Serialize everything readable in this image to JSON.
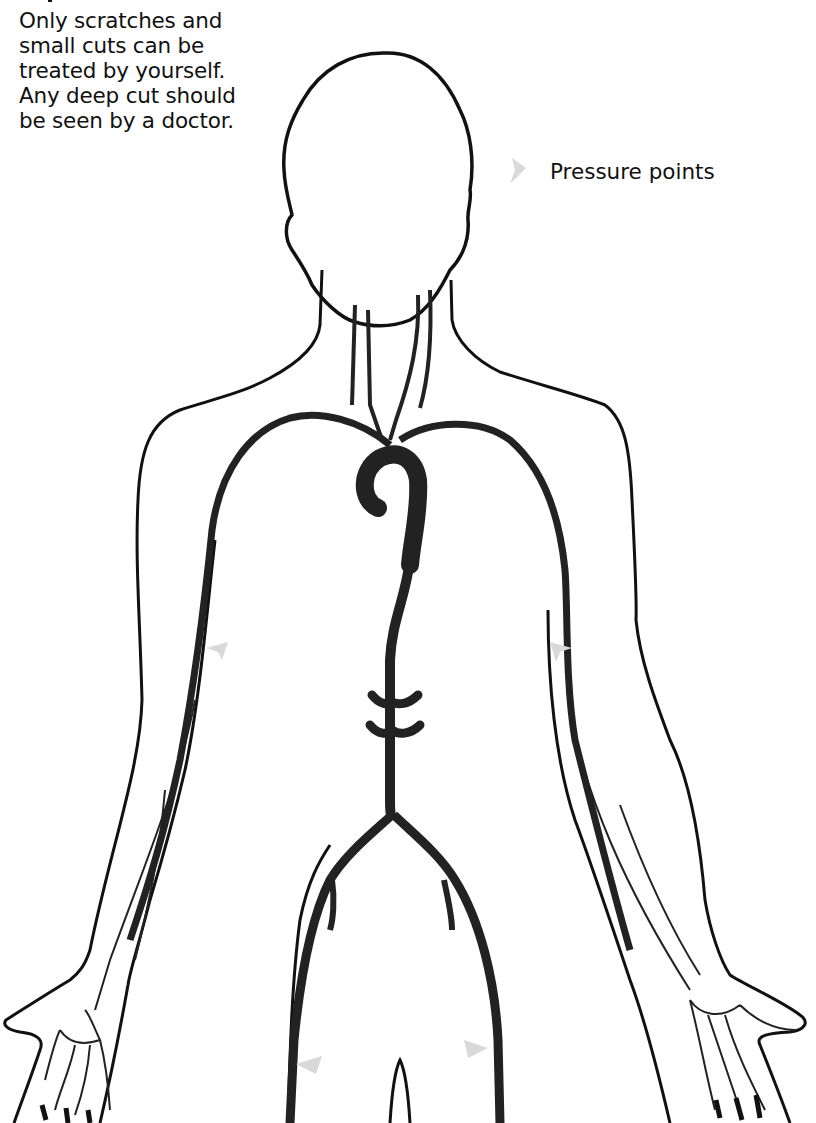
{
  "caption": {
    "lines": [
      "Only scratches and",
      "small cuts can be",
      "treated by yourself.",
      "Any deep cut should",
      "be seen by a doctor."
    ]
  },
  "legend": {
    "marker_icon": "pressure-point-arrow-icon",
    "label": "Pressure points",
    "marker_color": "#d9d9d9"
  },
  "figure": {
    "outline_color": "#111111",
    "artery_color": "#222222",
    "pressure_points": [
      {
        "location": "left upper arm (brachial)",
        "direction": "left"
      },
      {
        "location": "right upper arm (brachial)",
        "direction": "right"
      },
      {
        "location": "left groin (femoral)",
        "direction": "left"
      },
      {
        "location": "right groin (femoral)",
        "direction": "right"
      }
    ]
  }
}
